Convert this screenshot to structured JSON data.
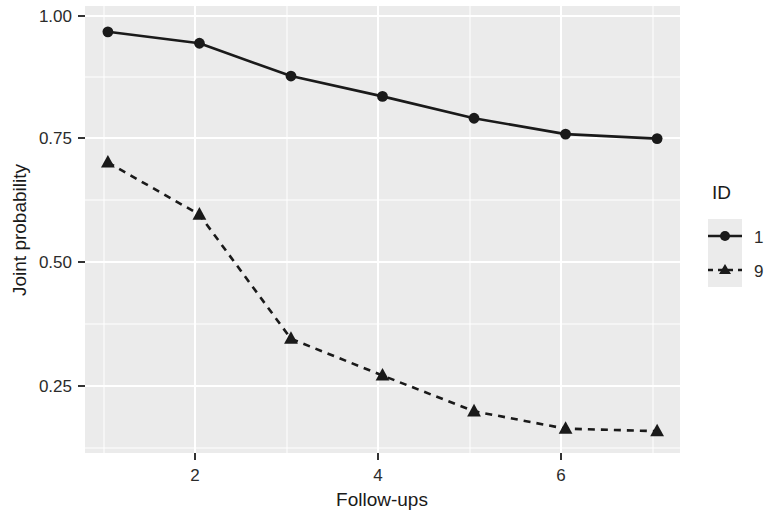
{
  "chart_data": {
    "type": "line",
    "title": "",
    "subtitle": "",
    "xlabel": "Follow-ups",
    "ylabel": "Joint probability",
    "x": [
      1,
      2,
      3,
      4,
      5,
      6,
      7
    ],
    "xlim": [
      0.75,
      7.25
    ],
    "ylim": [
      0.115,
      1.015
    ],
    "xticks": [
      2,
      4,
      6
    ],
    "xtick_labels": [
      "2",
      "4",
      "6"
    ],
    "yticks": [
      0.25,
      0.5,
      0.75,
      1.0
    ],
    "ytick_labels": [
      "0.25",
      "0.50",
      "0.75",
      "1.00"
    ],
    "grid": true,
    "grid_color": "#ffffff",
    "panel_background": "#ebebeb",
    "legend_position": "right",
    "legend_title": "ID",
    "series": [
      {
        "name": "1",
        "values": [
          0.963,
          0.94,
          0.874,
          0.833,
          0.789,
          0.757,
          0.748
        ],
        "linestyle": "solid",
        "marker": "circle",
        "color": "#1a1a1a"
      },
      {
        "name": "9",
        "values": [
          0.7,
          0.595,
          0.345,
          0.271,
          0.199,
          0.164,
          0.159
        ],
        "linestyle": "dashed",
        "marker": "triangle",
        "color": "#1a1a1a"
      }
    ]
  },
  "legend": {
    "title": "ID",
    "entries": [
      {
        "label": "1",
        "marker": "circle",
        "linestyle": "solid"
      },
      {
        "label": "9",
        "marker": "triangle",
        "linestyle": "dashed"
      }
    ]
  },
  "axes": {
    "x_title": "Follow-ups",
    "y_title": "Joint probability",
    "x_tick_labels": [
      "2",
      "4",
      "6"
    ],
    "y_tick_labels": [
      "0.25",
      "0.50",
      "0.75",
      "1.00"
    ]
  }
}
